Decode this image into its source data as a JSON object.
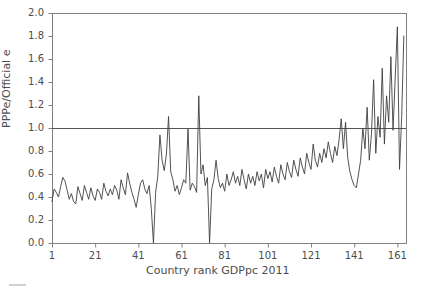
{
  "chart_data": {
    "type": "line",
    "title": "",
    "xlabel": "Country rank GDPpc 2011",
    "ylabel": "PPPe/Official e",
    "xlim": [
      1,
      165
    ],
    "ylim": [
      0.0,
      2.0
    ],
    "grid": false,
    "legend": null,
    "reference_lines": [
      {
        "orientation": "horizontal",
        "value": 1.0,
        "color": "#555555"
      }
    ],
    "yticks": [
      "0.0",
      "0.2",
      "0.4",
      "0.6",
      "0.8",
      "1.0",
      "1.2",
      "1.4",
      "1.6",
      "1.8",
      "2.0"
    ],
    "ytick_values": [
      0.0,
      0.2,
      0.4,
      0.6,
      0.8,
      1.0,
      1.2,
      1.4,
      1.6,
      1.8,
      2.0
    ],
    "xticks": [
      "1",
      "21",
      "41",
      "61",
      "81",
      "101",
      "121",
      "141",
      "161"
    ],
    "xtick_values": [
      1,
      21,
      41,
      61,
      81,
      101,
      121,
      141,
      161
    ],
    "series": [
      {
        "name": "PPPe/Official e",
        "color": "#404040",
        "x": [
          1,
          2,
          3,
          4,
          5,
          6,
          7,
          8,
          9,
          10,
          11,
          12,
          13,
          14,
          15,
          16,
          17,
          18,
          19,
          20,
          21,
          22,
          23,
          24,
          25,
          26,
          27,
          28,
          29,
          30,
          31,
          32,
          33,
          34,
          35,
          36,
          37,
          38,
          39,
          40,
          41,
          42,
          43,
          44,
          45,
          46,
          47,
          48,
          49,
          50,
          51,
          52,
          53,
          54,
          55,
          56,
          57,
          58,
          59,
          60,
          61,
          62,
          63,
          64,
          65,
          66,
          67,
          68,
          69,
          70,
          71,
          72,
          73,
          74,
          75,
          76,
          77,
          78,
          79,
          80,
          81,
          82,
          83,
          84,
          85,
          86,
          87,
          88,
          89,
          90,
          91,
          92,
          93,
          94,
          95,
          96,
          97,
          98,
          99,
          100,
          101,
          102,
          103,
          104,
          105,
          106,
          107,
          108,
          109,
          110,
          111,
          112,
          113,
          114,
          115,
          116,
          117,
          118,
          119,
          120,
          121,
          122,
          123,
          124,
          125,
          126,
          127,
          128,
          129,
          130,
          131,
          132,
          133,
          134,
          135,
          136,
          137,
          138,
          139,
          140,
          141,
          142,
          143,
          144,
          145,
          146,
          147,
          148,
          149,
          150,
          151,
          152,
          153,
          154,
          155,
          156,
          157,
          158,
          159,
          160,
          161,
          162,
          163,
          164
        ],
        "values": [
          0.36,
          0.47,
          0.44,
          0.4,
          0.49,
          0.57,
          0.54,
          0.46,
          0.38,
          0.43,
          0.36,
          0.34,
          0.49,
          0.43,
          0.37,
          0.5,
          0.44,
          0.38,
          0.48,
          0.41,
          0.37,
          0.47,
          0.44,
          0.38,
          0.52,
          0.45,
          0.41,
          0.47,
          0.42,
          0.5,
          0.46,
          0.38,
          0.55,
          0.48,
          0.42,
          0.61,
          0.52,
          0.44,
          0.38,
          0.31,
          0.42,
          0.52,
          0.55,
          0.47,
          0.43,
          0.5,
          0.3,
          0.0,
          0.44,
          0.58,
          0.94,
          0.72,
          0.63,
          0.77,
          1.1,
          0.62,
          0.55,
          0.45,
          0.5,
          0.42,
          0.48,
          0.55,
          0.52,
          0.99,
          0.46,
          0.52,
          0.49,
          0.44,
          1.28,
          0.6,
          0.68,
          0.5,
          0.57,
          0.0,
          0.47,
          0.55,
          0.72,
          0.56,
          0.48,
          0.52,
          0.45,
          0.6,
          0.5,
          0.55,
          0.62,
          0.52,
          0.58,
          0.5,
          0.64,
          0.55,
          0.47,
          0.6,
          0.52,
          0.58,
          0.5,
          0.62,
          0.54,
          0.6,
          0.48,
          0.64,
          0.56,
          0.62,
          0.53,
          0.66,
          0.58,
          0.52,
          0.68,
          0.6,
          0.55,
          0.7,
          0.62,
          0.57,
          0.72,
          0.64,
          0.58,
          0.74,
          0.66,
          0.6,
          0.78,
          0.7,
          0.64,
          0.86,
          0.72,
          0.66,
          0.78,
          0.7,
          0.82,
          0.74,
          0.88,
          0.78,
          0.7,
          0.84,
          0.76,
          0.9,
          1.08,
          0.82,
          1.05,
          0.74,
          0.62,
          0.55,
          0.5,
          0.48,
          0.6,
          0.72,
          1.0,
          0.82,
          1.18,
          0.72,
          0.95,
          1.42,
          0.78,
          1.1,
          0.92,
          1.52,
          0.86,
          1.28,
          1.05,
          1.62,
          0.98,
          1.44,
          1.88,
          0.64,
          1.1,
          1.8
        ]
      }
    ]
  },
  "figure": {
    "background_color": "#ffffff",
    "axes_color": "#808080",
    "text_color": "#4d4d4d",
    "line_color": "#404040"
  }
}
